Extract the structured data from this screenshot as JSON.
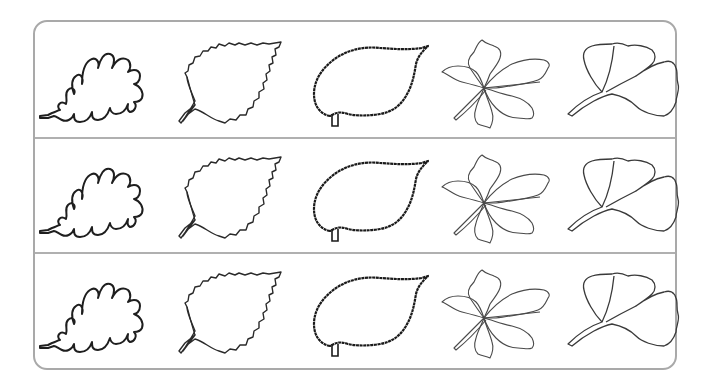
{
  "worksheet": {
    "rows": [
      {
        "leaves": [
          {
            "type": "oak"
          },
          {
            "type": "birch"
          },
          {
            "type": "beech"
          },
          {
            "type": "chestnut"
          },
          {
            "type": "ginkgo"
          }
        ]
      },
      {
        "leaves": [
          {
            "type": "oak"
          },
          {
            "type": "birch"
          },
          {
            "type": "beech"
          },
          {
            "type": "chestnut"
          },
          {
            "type": "ginkgo"
          }
        ]
      },
      {
        "leaves": [
          {
            "type": "oak"
          },
          {
            "type": "birch"
          },
          {
            "type": "beech"
          },
          {
            "type": "chestnut"
          },
          {
            "type": "ginkgo"
          }
        ]
      }
    ],
    "colors": {
      "frame": "#a9a9a9",
      "divider": "#b0b0b0",
      "thick_outline": "#1e1e1e",
      "thin_outline": "#4a4a4a",
      "background": "#ffffff"
    }
  }
}
